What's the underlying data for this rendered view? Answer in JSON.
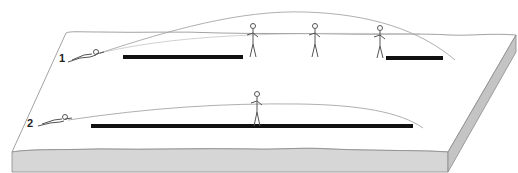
{
  "diagram": {
    "type": "illustration",
    "colors": {
      "background": "#ffffff",
      "terrain_top": "#ffffff",
      "terrain_face": "#d6d6d6",
      "outline": "#8a8a8a",
      "trajectory": "#9a9a9a",
      "danger_bar": "#111111",
      "figure": "#555555"
    },
    "scenarios": [
      {
        "label": "1",
        "shooter": "prone-rifleman",
        "standing_figures": 3,
        "danger_zones": 2
      },
      {
        "label": "2",
        "shooter": "prone-rifleman",
        "standing_figures": 1,
        "danger_zones": 1
      }
    ]
  }
}
